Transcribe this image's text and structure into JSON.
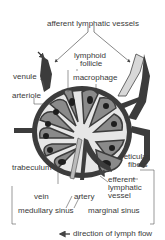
{
  "diagram": {
    "labels": {
      "afferent": "afferent lymphatic vessels",
      "follicle_1": "lymphoid",
      "follicle_2": "follicle",
      "venule": "venule",
      "macrophage": "macrophage",
      "arteriole": "arteriole",
      "trabeculum": "trabeculum",
      "reticular_1": "reticular",
      "reticular_2": "fibers",
      "efferent_1": "efferent",
      "efferent_2": "lymphatic",
      "efferent_3": "vessel",
      "vein": "vein",
      "artery": "artery",
      "medullary": "medullary sinus",
      "marginal": "marginal sinus",
      "legend": "direction of lymph flow"
    },
    "colors": {
      "capsule": "#3c3c3c",
      "sinus": "#e6e6e6",
      "follicle": "#8a8a8a",
      "germinal": "#1e1e1e",
      "vessel_light": "#d8d8d8",
      "line": "#555555"
    }
  }
}
